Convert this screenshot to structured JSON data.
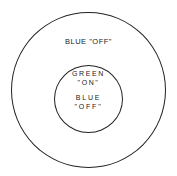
{
  "diagram": {
    "outer_region": {
      "label": "BLUE \"OFF\""
    },
    "inner_region": {
      "line1": "GREEN",
      "line2": "\"ON\"",
      "line3": "BLUE",
      "line4": "\"OFF\""
    }
  }
}
